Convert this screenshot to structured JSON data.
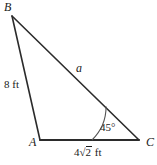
{
  "figure": {
    "type": "triangle-diagram",
    "width": 157,
    "height": 165,
    "background_color": "#ffffff",
    "stroke_color": "#2b2b2b",
    "text_color": "#1a1a1a"
  },
  "vertices": {
    "b": {
      "label": "B",
      "x": 12,
      "y": 16
    },
    "a": {
      "label": "A",
      "x": 40,
      "y": 140
    },
    "c": {
      "label": "C",
      "x": 139,
      "y": 140
    }
  },
  "sides": {
    "ab": {
      "label": "8 ft",
      "value": "8",
      "unit": "ft"
    },
    "bc": {
      "label": "a",
      "value": "a",
      "unit": ""
    },
    "ac": {
      "label": "4√2 ft",
      "coefficient": "4",
      "radical_sign": "√",
      "radicand": "2",
      "unit": "ft"
    }
  },
  "angles": {
    "c": {
      "label": "45°",
      "value": "45",
      "unit": "°",
      "at_vertex": "C"
    }
  }
}
